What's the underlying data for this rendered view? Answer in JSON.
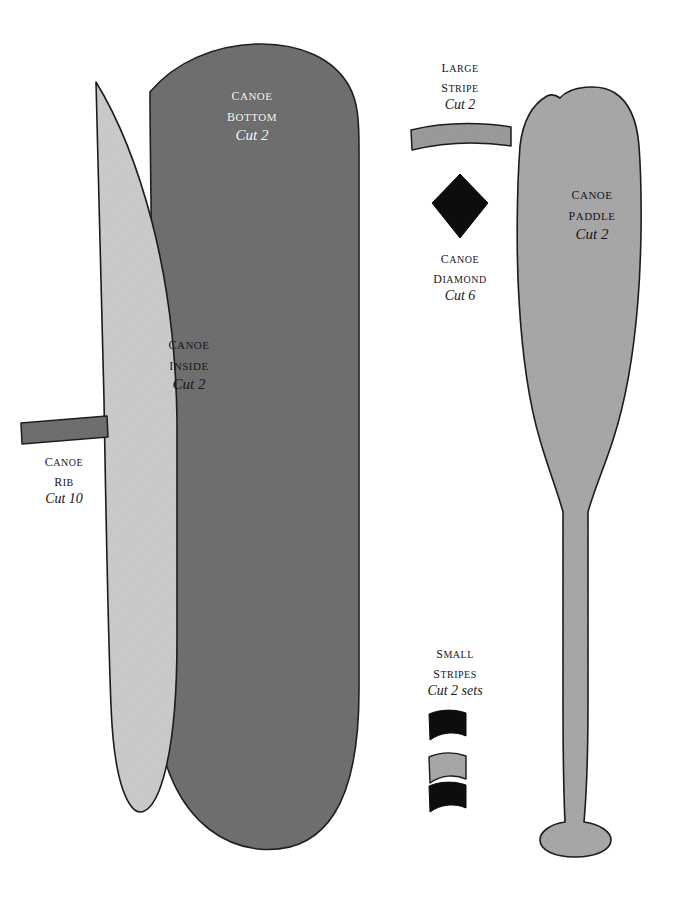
{
  "page": {
    "width": 675,
    "height": 902,
    "background": "#ffffff"
  },
  "palette": {
    "dark_gray": "#6b6b6b",
    "medium_gray": "#9b9b9b",
    "light_gray": "#cbcbcb",
    "black": "#0d0d0d",
    "outline": "#1c1c1c",
    "white_text": "#ffffff",
    "dark_text": "#17161a"
  },
  "pieces": [
    {
      "id": "canoe-bottom",
      "name": "Canoe",
      "name2": "Bottom",
      "cut": "Cut 2",
      "fill": "#6b6b6b",
      "label_color": "white",
      "label_x": 252,
      "label_y": 84
    },
    {
      "id": "canoe-inside",
      "name": "Canoe",
      "name2": "Inside",
      "cut": "Cut 2",
      "fill": "#cbcbcb",
      "label_color": "dark",
      "label_x": 189,
      "label_y": 333
    },
    {
      "id": "canoe-rib",
      "name": "Canoe",
      "name2": "Rib",
      "cut": "Cut 10",
      "fill": "#6b6b6b",
      "label_color": "dark",
      "label_x": 63,
      "label_y": 451
    },
    {
      "id": "large-stripe",
      "name": "Large",
      "name2": "Stripe",
      "cut": "Cut 2",
      "fill": "#9b9b9b",
      "label_color": "dark",
      "label_x": 460,
      "label_y": 58
    },
    {
      "id": "canoe-diamond",
      "name": "Canoe",
      "name2": "Diamond",
      "cut": "Cut 6",
      "fill": "#0d0d0d",
      "label_color": "dark",
      "label_x": 460,
      "label_y": 248
    },
    {
      "id": "canoe-paddle",
      "name": "Canoe",
      "name2": "Paddle",
      "cut": "Cut 2",
      "fill": "#a8a8a8",
      "label_color": "dark",
      "label_x": 592,
      "label_y": 185
    },
    {
      "id": "small-stripes",
      "name": "Small",
      "name2": "Stripes",
      "cut": "Cut 2 sets",
      "fill": "#0d0d0d",
      "label_color": "dark",
      "label_x": 455,
      "label_y": 644
    }
  ],
  "small_stripe_swatches": [
    {
      "id": "small-stripe-top",
      "fill": "#0d0d0d"
    },
    {
      "id": "small-stripe-middle",
      "fill": "#a8a8a8"
    },
    {
      "id": "small-stripe-bottom",
      "fill": "#0d0d0d"
    }
  ]
}
